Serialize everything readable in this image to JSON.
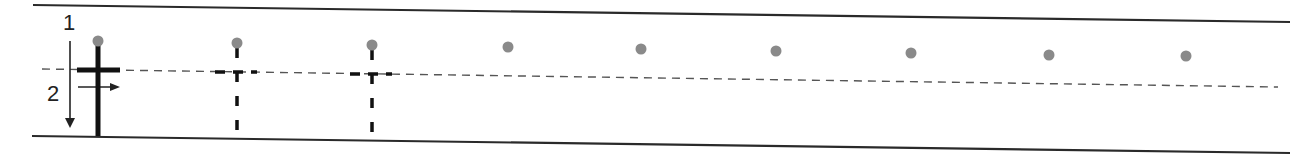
{
  "worksheet": {
    "letter": "t",
    "stroke_labels": {
      "first": "1",
      "second": "2"
    },
    "colors": {
      "rule": "#2a2a2a",
      "midline": "#555555",
      "letter": "#111111",
      "dot": "#8a8a8a"
    },
    "guide_letter": {
      "x": 98,
      "style": "solid"
    },
    "traced_letters": [
      {
        "x": 237,
        "style": "dashed"
      },
      {
        "x": 372,
        "style": "dashed"
      }
    ],
    "dots": [
      {
        "x": 98,
        "y": 41
      },
      {
        "x": 237,
        "y": 43
      },
      {
        "x": 372,
        "y": 45
      },
      {
        "x": 508,
        "y": 47
      },
      {
        "x": 641,
        "y": 49
      },
      {
        "x": 776,
        "y": 51
      },
      {
        "x": 911,
        "y": 53
      },
      {
        "x": 1049,
        "y": 55
      },
      {
        "x": 1186,
        "y": 56
      }
    ]
  }
}
